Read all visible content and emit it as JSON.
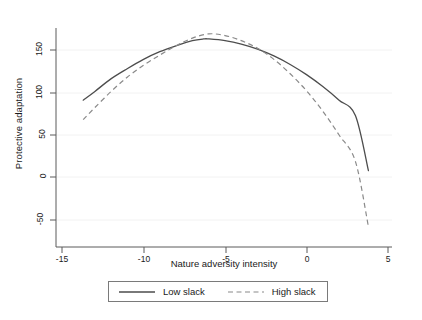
{
  "chart_data": {
    "type": "line",
    "title": "",
    "xlabel": "Nature adversity intensity",
    "ylabel": "Protective adaptation",
    "xlim": [
      -15.8,
      5.6
    ],
    "ylim": [
      -70,
      180
    ],
    "xticks": [
      -15,
      -10,
      -5,
      0,
      5
    ],
    "xtick_labels": [
      "-15",
      "-10",
      "-5",
      "0",
      "5"
    ],
    "yticks": [
      -50,
      0,
      50,
      100,
      150
    ],
    "ytick_labels": [
      "-50",
      "0",
      "50",
      "100",
      "150"
    ],
    "grid": "horizontal-faint",
    "legend_position": "below-axis-boxed",
    "series": [
      {
        "name": "Low slack",
        "style": "solid",
        "color": "#4d4d4d",
        "vertex_x": -6.3,
        "vertex_y": 163,
        "x": [
          -13.7,
          -13.0,
          -12.0,
          -11.0,
          -10.0,
          -9.0,
          -8.0,
          -7.0,
          -6.3,
          -6.0,
          -5.0,
          -4.0,
          -3.0,
          -2.0,
          -1.0,
          0.0,
          1.0,
          2.0,
          3.0,
          3.8
        ],
        "y": [
          91,
          101,
          116,
          128,
          139,
          148,
          155,
          161,
          163,
          163,
          161,
          157,
          151,
          143,
          133,
          121,
          107,
          91,
          73,
          8
        ]
      },
      {
        "name": "High slack",
        "style": "dashed",
        "color": "#8a8a8a",
        "vertex_x": -6.0,
        "vertex_y": 169,
        "x": [
          -13.7,
          -13.0,
          -12.0,
          -11.0,
          -10.0,
          -9.0,
          -8.0,
          -7.0,
          -6.0,
          -5.0,
          -4.0,
          -3.0,
          -2.0,
          -1.0,
          0.0,
          1.0,
          2.0,
          3.0,
          3.8
        ],
        "y": [
          68,
          82,
          101,
          118,
          132,
          144,
          155,
          164,
          169,
          167,
          161,
          152,
          139,
          122,
          102,
          78,
          50,
          19,
          -58
        ]
      }
    ]
  },
  "legend": {
    "entries": [
      {
        "label": "Low slack",
        "style": "solid"
      },
      {
        "label": "High slack",
        "style": "dashed"
      }
    ]
  },
  "axes": {
    "x_title": "Nature adversity intensity",
    "y_title": "Protective adaptation"
  }
}
